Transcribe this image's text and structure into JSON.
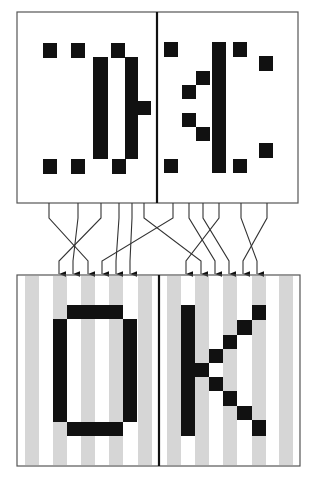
{
  "diagram": {
    "title": "Scrambled pixel columns unscrambled into OK",
    "colors": {
      "ink": "#111111",
      "border": "#555555",
      "divider": "#111111",
      "stripe": "#d6d6d6",
      "background": "#ffffff",
      "wire": "#333333"
    },
    "cell": 14,
    "top_panel": {
      "label": "scrambled input",
      "frame": {
        "x": 17,
        "y": 12,
        "w": 281,
        "h": 191
      },
      "divider_x": 157,
      "blocks": [
        {
          "x": 43,
          "y": 43,
          "w": 14,
          "h": 15
        },
        {
          "x": 71,
          "y": 43,
          "w": 14,
          "h": 15
        },
        {
          "x": 111,
          "y": 43,
          "w": 14,
          "h": 15
        },
        {
          "x": 93,
          "y": 57,
          "w": 15,
          "h": 102
        },
        {
          "x": 125,
          "y": 57,
          "w": 13,
          "h": 102
        },
        {
          "x": 138,
          "y": 101,
          "w": 13,
          "h": 14
        },
        {
          "x": 43,
          "y": 159,
          "w": 14,
          "h": 15
        },
        {
          "x": 71,
          "y": 159,
          "w": 14,
          "h": 15
        },
        {
          "x": 112,
          "y": 159,
          "w": 14,
          "h": 15
        },
        {
          "x": 164,
          "y": 42,
          "w": 14,
          "h": 15
        },
        {
          "x": 212,
          "y": 42,
          "w": 14,
          "h": 131
        },
        {
          "x": 233,
          "y": 42,
          "w": 14,
          "h": 15
        },
        {
          "x": 259,
          "y": 56,
          "w": 14,
          "h": 15
        },
        {
          "x": 196,
          "y": 71,
          "w": 14,
          "h": 14
        },
        {
          "x": 182,
          "y": 85,
          "w": 14,
          "h": 14
        },
        {
          "x": 182,
          "y": 113,
          "w": 14,
          "h": 14
        },
        {
          "x": 196,
          "y": 127,
          "w": 14,
          "h": 14
        },
        {
          "x": 259,
          "y": 143,
          "w": 14,
          "h": 15
        },
        {
          "x": 164,
          "y": 159,
          "w": 14,
          "h": 14
        },
        {
          "x": 233,
          "y": 159,
          "w": 14,
          "h": 14
        }
      ]
    },
    "wires": {
      "top_y": 203,
      "bend_y": 218,
      "end_y": 261,
      "arrow_tip_y": 275,
      "paths": [
        {
          "from": 49,
          "to": 88
        },
        {
          "from": 78,
          "to": 73
        },
        {
          "from": 101,
          "to": 59
        },
        {
          "from": 119,
          "to": 116
        },
        {
          "from": 132,
          "to": 130
        },
        {
          "from": 144,
          "to": 201
        },
        {
          "from": 173,
          "to": 102
        },
        {
          "from": 189,
          "to": 215
        },
        {
          "from": 203,
          "to": 229
        },
        {
          "from": 219,
          "to": 186
        },
        {
          "from": 241,
          "to": 257
        },
        {
          "from": 267,
          "to": 243
        }
      ]
    },
    "bottom_panel": {
      "label": "decoded output",
      "text": "OK",
      "frame": {
        "x": 17,
        "y": 275,
        "w": 283,
        "h": 191
      },
      "divider_x": 159,
      "stripes": [
        {
          "x": 25,
          "w": 14
        },
        {
          "x": 53,
          "w": 14
        },
        {
          "x": 81,
          "w": 14
        },
        {
          "x": 109,
          "w": 14
        },
        {
          "x": 138,
          "w": 14
        },
        {
          "x": 167,
          "w": 14
        },
        {
          "x": 195,
          "w": 14
        },
        {
          "x": 223,
          "w": 14
        },
        {
          "x": 252,
          "w": 14
        },
        {
          "x": 279,
          "w": 14
        }
      ],
      "letter_o": [
        {
          "x": 67,
          "y": 305,
          "w": 56,
          "h": 14
        },
        {
          "x": 53,
          "y": 319,
          "w": 14,
          "h": 103
        },
        {
          "x": 123,
          "y": 319,
          "w": 14,
          "h": 103
        },
        {
          "x": 67,
          "y": 422,
          "w": 56,
          "h": 14
        }
      ],
      "letter_k": [
        {
          "x": 181,
          "y": 305,
          "w": 14,
          "h": 131
        },
        {
          "x": 195,
          "y": 363,
          "w": 14,
          "h": 14
        },
        {
          "x": 209,
          "y": 349,
          "w": 14,
          "h": 14
        },
        {
          "x": 223,
          "y": 335,
          "w": 14,
          "h": 14
        },
        {
          "x": 237,
          "y": 320,
          "w": 15,
          "h": 15
        },
        {
          "x": 252,
          "y": 305,
          "w": 14,
          "h": 15
        },
        {
          "x": 209,
          "y": 377,
          "w": 14,
          "h": 14
        },
        {
          "x": 223,
          "y": 391,
          "w": 14,
          "h": 15
        },
        {
          "x": 237,
          "y": 406,
          "w": 15,
          "h": 14
        },
        {
          "x": 252,
          "y": 420,
          "w": 14,
          "h": 16
        }
      ]
    }
  }
}
